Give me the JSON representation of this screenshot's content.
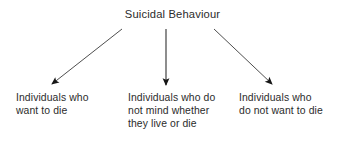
{
  "diagram": {
    "type": "tree-diagram",
    "background_color": "#ffffff",
    "text_color": "#2b2b2b",
    "stroke_color": "#3a3a3a",
    "root": {
      "label": "Suicidal Behaviour"
    },
    "branches": [
      {
        "id": "left",
        "arrow": {
          "from_x": 122,
          "from_y": 29,
          "to_x": 52,
          "to_y": 84
        },
        "lines": [
          "Individuals who",
          "want to die"
        ]
      },
      {
        "id": "middle",
        "arrow": {
          "from_x": 166,
          "from_y": 29,
          "to_x": 166,
          "to_y": 85
        },
        "lines": [
          "Individuals who do",
          "not mind whether",
          "they live or die"
        ]
      },
      {
        "id": "right",
        "arrow": {
          "from_x": 214,
          "from_y": 29,
          "to_x": 272,
          "to_y": 84
        },
        "lines": [
          "Individuals who",
          "do not want to die"
        ]
      }
    ]
  }
}
